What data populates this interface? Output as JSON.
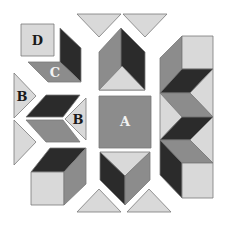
{
  "colors": {
    "light": "#d9d9d9",
    "medium": "#8c8c8c",
    "dark": "#2b2b2b",
    "outline": "#7a7a7a",
    "label_dark": "#1a1a1a",
    "label_light": "#f2f2f2"
  },
  "labels": {
    "a": "A",
    "b_left": "B",
    "b_right": "B",
    "c": "C",
    "d": "D"
  },
  "pieces": [
    {
      "id": "square-d",
      "label": "D",
      "shape": "square",
      "shade": "light"
    },
    {
      "id": "parallelogram-c",
      "label": "C",
      "shape": "parallelogram",
      "shade": "medium"
    },
    {
      "id": "parallelogram-dark-top-left",
      "label": "",
      "shape": "parallelogram",
      "shade": "dark"
    },
    {
      "id": "triangle-b-left",
      "label": "B",
      "shape": "triangle",
      "shade": "light"
    },
    {
      "id": "triangle-b-right",
      "label": "B",
      "shape": "triangle",
      "shade": "light"
    },
    {
      "id": "square-a",
      "label": "A",
      "shape": "square",
      "shade": "medium"
    },
    {
      "id": "chevron-left",
      "label": "",
      "shape": "chevron",
      "shade": "dark+medium"
    },
    {
      "id": "cube-bottom-left",
      "label": "",
      "shape": "cube",
      "shade": "light+medium+dark"
    },
    {
      "id": "cube-top-center",
      "label": "",
      "shape": "cube",
      "shade": "medium+dark+light"
    },
    {
      "id": "cube-bottom-center",
      "label": "",
      "shape": "cube",
      "shade": "light+dark+medium"
    },
    {
      "id": "column-right",
      "label": "",
      "shape": "stacked-cubes",
      "shade": "mixed"
    },
    {
      "id": "triangles-top",
      "label": "",
      "shape": "triangle",
      "shade": "light"
    },
    {
      "id": "triangles-bottom",
      "label": "",
      "shape": "triangle",
      "shade": "light"
    }
  ]
}
